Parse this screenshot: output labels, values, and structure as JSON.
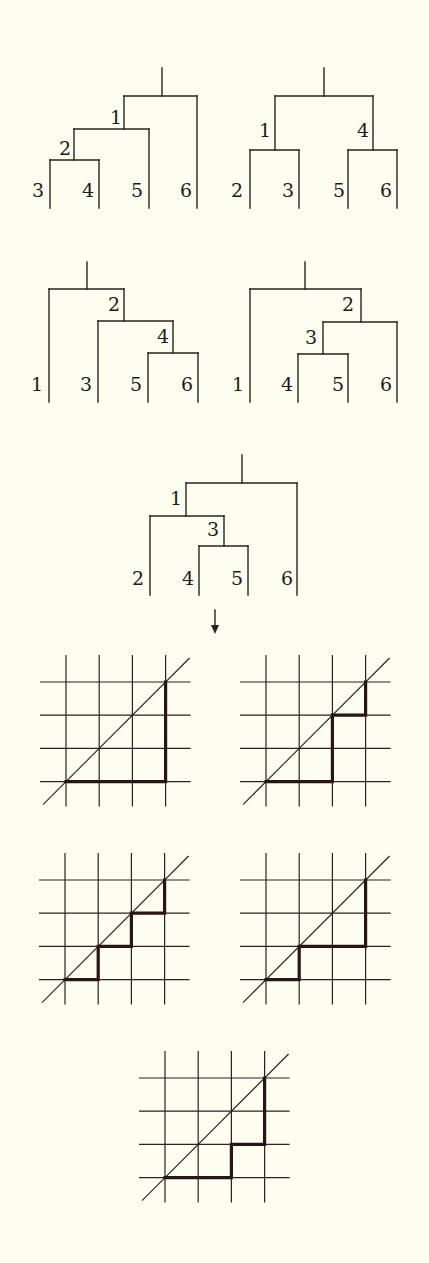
{
  "figure": {
    "colors": {
      "background": "#fdfdf0",
      "ink": "#2a2220",
      "path": "#2a1414"
    },
    "arrow": {
      "glyph": "↓",
      "meaning": "bijection-arrow"
    }
  },
  "trees": [
    {
      "id": "tree-1",
      "origin": [
        50,
        68
      ],
      "leaves": [
        "3",
        "4",
        "5",
        "6"
      ],
      "internal_labels": [
        "1",
        "2"
      ],
      "segments": [
        [
          162,
          68,
          162,
          96
        ],
        [
          124,
          96,
          197,
          96
        ],
        [
          124,
          96,
          124,
          129
        ],
        [
          197,
          96,
          197,
          208
        ],
        [
          74,
          129,
          149,
          129
        ],
        [
          74,
          129,
          74,
          160
        ],
        [
          149,
          129,
          149,
          208
        ],
        [
          50,
          160,
          99,
          160
        ],
        [
          50,
          160,
          50,
          208
        ],
        [
          99,
          160,
          99,
          208
        ]
      ],
      "labels": [
        {
          "text": "1",
          "x": 110,
          "y": 124
        },
        {
          "text": "2",
          "x": 59,
          "y": 155
        },
        {
          "text": "3",
          "x": 32,
          "y": 197
        },
        {
          "text": "4",
          "x": 82,
          "y": 197
        },
        {
          "text": "5",
          "x": 131,
          "y": 197
        },
        {
          "text": "6",
          "x": 180,
          "y": 197
        }
      ]
    },
    {
      "id": "tree-2",
      "origin": [
        250,
        68
      ],
      "leaves": [
        "2",
        "3",
        "5",
        "6"
      ],
      "internal_labels": [
        "1",
        "4"
      ],
      "segments": [
        [
          324,
          68,
          324,
          96
        ],
        [
          275,
          96,
          373,
          96
        ],
        [
          275,
          96,
          275,
          150
        ],
        [
          373,
          96,
          373,
          150
        ],
        [
          250,
          150,
          299,
          150
        ],
        [
          250,
          150,
          250,
          208
        ],
        [
          299,
          150,
          299,
          208
        ],
        [
          348,
          150,
          397,
          150
        ],
        [
          348,
          150,
          348,
          208
        ],
        [
          397,
          150,
          397,
          208
        ]
      ],
      "labels": [
        {
          "text": "1",
          "x": 259,
          "y": 137
        },
        {
          "text": "4",
          "x": 357,
          "y": 137
        },
        {
          "text": "2",
          "x": 231,
          "y": 197
        },
        {
          "text": "3",
          "x": 282,
          "y": 197
        },
        {
          "text": "5",
          "x": 333,
          "y": 197
        },
        {
          "text": "6",
          "x": 380,
          "y": 197
        }
      ]
    },
    {
      "id": "tree-3",
      "origin": [
        49,
        262
      ],
      "leaves": [
        "1",
        "3",
        "5",
        "6"
      ],
      "internal_labels": [
        "2",
        "4"
      ],
      "segments": [
        [
          87,
          262,
          87,
          289
        ],
        [
          49,
          289,
          124,
          289
        ],
        [
          49,
          289,
          49,
          402
        ],
        [
          124,
          289,
          124,
          321
        ],
        [
          98,
          321,
          173,
          321
        ],
        [
          98,
          321,
          98,
          402
        ],
        [
          173,
          321,
          173,
          353
        ],
        [
          148,
          353,
          198,
          353
        ],
        [
          148,
          353,
          148,
          402
        ],
        [
          198,
          353,
          198,
          402
        ]
      ],
      "labels": [
        {
          "text": "2",
          "x": 108,
          "y": 311
        },
        {
          "text": "4",
          "x": 157,
          "y": 343
        },
        {
          "text": "1",
          "x": 31,
          "y": 391
        },
        {
          "text": "3",
          "x": 80,
          "y": 391
        },
        {
          "text": "5",
          "x": 130,
          "y": 391
        },
        {
          "text": "6",
          "x": 181,
          "y": 391
        }
      ]
    },
    {
      "id": "tree-4",
      "origin": [
        250,
        262
      ],
      "leaves": [
        "1",
        "4",
        "5",
        "6"
      ],
      "internal_labels": [
        "2",
        "3"
      ],
      "segments": [
        [
          305,
          262,
          305,
          289
        ],
        [
          250,
          289,
          361,
          289
        ],
        [
          250,
          289,
          250,
          402
        ],
        [
          361,
          289,
          361,
          322
        ],
        [
          323,
          322,
          397,
          322
        ],
        [
          323,
          322,
          323,
          354
        ],
        [
          397,
          322,
          397,
          402
        ],
        [
          298,
          354,
          348,
          354
        ],
        [
          298,
          354,
          298,
          402
        ],
        [
          348,
          354,
          348,
          402
        ]
      ],
      "labels": [
        {
          "text": "2",
          "x": 342,
          "y": 311
        },
        {
          "text": "3",
          "x": 305,
          "y": 344
        },
        {
          "text": "1",
          "x": 232,
          "y": 391
        },
        {
          "text": "4",
          "x": 281,
          "y": 391
        },
        {
          "text": "5",
          "x": 332,
          "y": 391
        },
        {
          "text": "6",
          "x": 380,
          "y": 391
        }
      ]
    },
    {
      "id": "tree-5",
      "origin": [
        150,
        455
      ],
      "leaves": [
        "2",
        "4",
        "5",
        "6"
      ],
      "internal_labels": [
        "1",
        "3"
      ],
      "segments": [
        [
          242,
          455,
          242,
          483
        ],
        [
          186,
          483,
          297,
          483
        ],
        [
          186,
          483,
          186,
          516
        ],
        [
          297,
          483,
          297,
          595
        ],
        [
          150,
          516,
          224,
          516
        ],
        [
          150,
          516,
          150,
          595
        ],
        [
          224,
          516,
          224,
          546
        ],
        [
          199,
          546,
          248,
          546
        ],
        [
          199,
          546,
          199,
          595
        ],
        [
          248,
          546,
          248,
          595
        ]
      ],
      "labels": [
        {
          "text": "1",
          "x": 170,
          "y": 505
        },
        {
          "text": "3",
          "x": 207,
          "y": 536
        },
        {
          "text": "2",
          "x": 132,
          "y": 585
        },
        {
          "text": "4",
          "x": 182,
          "y": 585
        },
        {
          "text": "5",
          "x": 231,
          "y": 585
        },
        {
          "text": "6",
          "x": 281,
          "y": 585
        }
      ]
    }
  ],
  "lattices": [
    {
      "id": "lattice-1",
      "left": 66,
      "top": 682,
      "cell": 33.2,
      "path_steps": "EEEN N N",
      "path_points": [
        [
          0,
          3
        ],
        [
          3,
          3
        ],
        [
          3,
          0
        ]
      ]
    },
    {
      "id": "lattice-2",
      "left": 266,
      "top": 682,
      "cell": 33.2,
      "path_points": [
        [
          0,
          3
        ],
        [
          2,
          3
        ],
        [
          2,
          1
        ],
        [
          3,
          1
        ],
        [
          3,
          0
        ]
      ]
    },
    {
      "id": "lattice-3",
      "left": 65,
      "top": 880,
      "cell": 33.2,
      "path_points": [
        [
          0,
          3
        ],
        [
          1,
          3
        ],
        [
          1,
          2
        ],
        [
          2,
          2
        ],
        [
          2,
          1
        ],
        [
          3,
          1
        ],
        [
          3,
          0
        ]
      ]
    },
    {
      "id": "lattice-4",
      "left": 266,
      "top": 880,
      "cell": 33.2,
      "path_points": [
        [
          0,
          3
        ],
        [
          1,
          3
        ],
        [
          1,
          2
        ],
        [
          3,
          2
        ],
        [
          3,
          0
        ]
      ]
    },
    {
      "id": "lattice-5",
      "left": 165,
      "top": 1078,
      "cell": 33.2,
      "path_points": [
        [
          0,
          3
        ],
        [
          2,
          3
        ],
        [
          2,
          2
        ],
        [
          3,
          2
        ],
        [
          3,
          0
        ]
      ]
    }
  ]
}
